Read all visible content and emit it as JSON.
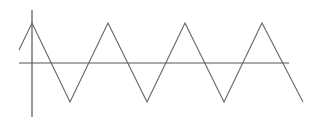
{
  "diagram": {
    "title": "",
    "type": "triangle-wave",
    "colors": {
      "axis": "#555555",
      "wave": "#666666",
      "background": "#ffffff"
    },
    "axes": {
      "x_axis": {
        "x1": 19,
        "y": 63,
        "x2": 289
      },
      "y_axis": {
        "x": 32,
        "y1": 10,
        "y2": 117
      }
    },
    "wave_points": [
      [
        19,
        50
      ],
      [
        32,
        23
      ],
      [
        70,
        102
      ],
      [
        108,
        23
      ],
      [
        147,
        102
      ],
      [
        185,
        23
      ],
      [
        224,
        102
      ],
      [
        262,
        23
      ],
      [
        303,
        102
      ]
    ]
  }
}
